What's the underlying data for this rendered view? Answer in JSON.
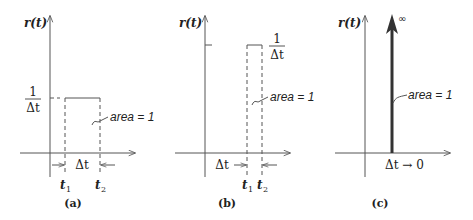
{
  "figure": {
    "y_label": "r(t)",
    "area_label": "area = 1",
    "panels": [
      {
        "id": "a",
        "caption": "(a)",
        "height_numerator": "1",
        "height_denominator": "Δt",
        "width_label": "Δt",
        "t1_label": "t",
        "t1_sub": "1",
        "t2_label": "t",
        "t2_sub": "2"
      },
      {
        "id": "b",
        "caption": "(b)",
        "height_numerator": "1",
        "height_denominator": "Δt",
        "width_label": "Δt",
        "t1_label": "t",
        "t1_sub": "1",
        "t2_label": "t",
        "t2_sub": "2"
      },
      {
        "id": "c",
        "caption": "(c)",
        "infinity_label": "∞",
        "limit_label": "Δt → 0"
      }
    ]
  }
}
